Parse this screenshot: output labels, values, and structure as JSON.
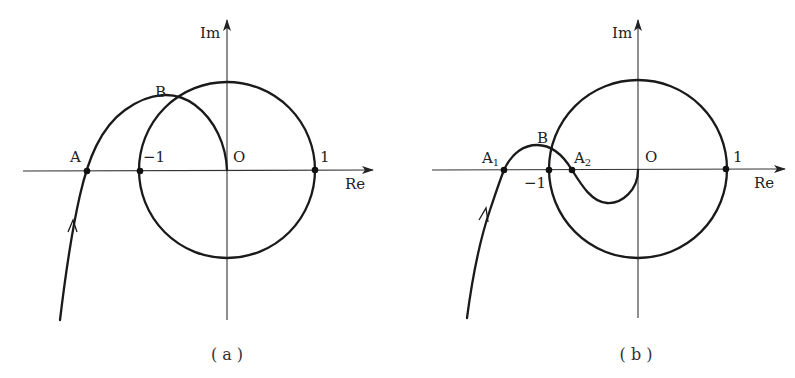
{
  "figure": {
    "panels": [
      {
        "id": "a",
        "caption": "( a )",
        "axes": {
          "x_label": "Re",
          "y_label": "Im",
          "origin_label": "O"
        },
        "points": {
          "A": "A",
          "B": "B",
          "minus_one": "−1",
          "one": "1"
        }
      },
      {
        "id": "b",
        "caption": "( b )",
        "axes": {
          "x_label": "Re",
          "y_label": "Im",
          "origin_label": "O"
        },
        "points": {
          "A1_base": "A",
          "A1_sub": "1",
          "A2_base": "A",
          "A2_sub": "2",
          "B": "B",
          "minus_one": "−1",
          "one": "1"
        }
      }
    ]
  }
}
